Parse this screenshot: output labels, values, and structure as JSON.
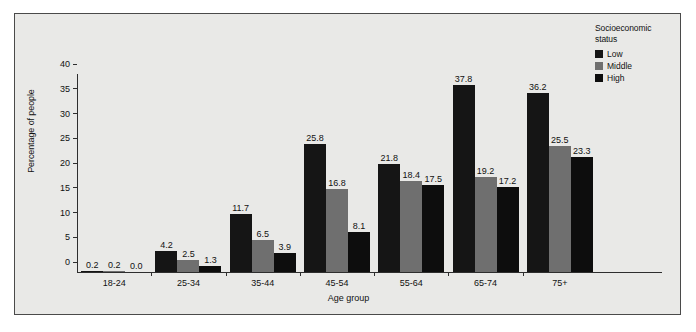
{
  "legend": {
    "title_line1": "Socioeconomic",
    "title_line2": "status",
    "items": [
      {
        "label": "Low",
        "color": "#151515"
      },
      {
        "label": "Middle",
        "color": "#6f6f6f"
      },
      {
        "label": "High",
        "color": "#0d0d0d"
      }
    ]
  },
  "axes": {
    "ylabel": "Percentage of people",
    "xlabel": "Age group",
    "yticks": [
      "0",
      "5",
      "10",
      "15",
      "20",
      "25",
      "30",
      "35",
      "40"
    ]
  },
  "chart_data": {
    "type": "bar",
    "title": "",
    "xlabel": "Age group",
    "ylabel": "Percentage of people",
    "ylim": [
      0,
      40
    ],
    "ytick_step": 5,
    "grid": false,
    "legend_position": "top-right",
    "legend_title": "Socioeconomic status",
    "categories": [
      "18-24",
      "25-34",
      "35-44",
      "45-54",
      "55-64",
      "65-74",
      "75+"
    ],
    "series": [
      {
        "name": "Low",
        "color": "#151515",
        "values": [
          0.2,
          4.2,
          11.7,
          25.8,
          21.8,
          37.8,
          36.2
        ]
      },
      {
        "name": "Middle",
        "color": "#6f6f6f",
        "values": [
          0.2,
          2.5,
          6.5,
          16.8,
          18.4,
          19.2,
          25.5
        ]
      },
      {
        "name": "High",
        "color": "#0d0d0d",
        "values": [
          0.0,
          1.3,
          3.9,
          8.1,
          17.5,
          17.2,
          23.3
        ]
      }
    ],
    "data_labels": [
      [
        "0.2",
        "0.2",
        "0.0"
      ],
      [
        "4.2",
        "2.5",
        "1.3"
      ],
      [
        "11.7",
        "6.5",
        "3.9"
      ],
      [
        "25.8",
        "16.8",
        "8.1"
      ],
      [
        "21.8",
        "18.4",
        "17.5"
      ],
      [
        "37.8",
        "19.2",
        "17.2"
      ],
      [
        "36.2",
        "25.5",
        "23.3"
      ]
    ]
  }
}
